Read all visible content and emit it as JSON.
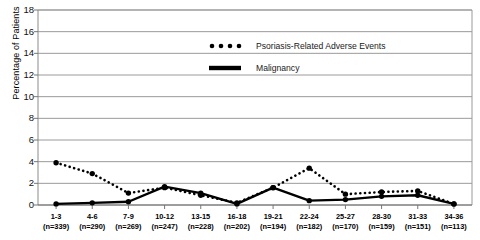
{
  "chart_data": {
    "type": "line",
    "title": "",
    "xlabel": "",
    "ylabel": "Percentage of Patients",
    "ylim": [
      0,
      18
    ],
    "yticks": [
      0,
      2,
      4,
      6,
      8,
      10,
      12,
      14,
      16,
      18
    ],
    "grid": true,
    "legend_position": "top-right",
    "categories": [
      "1-3",
      "4-6",
      "7-9",
      "10-12",
      "13-15",
      "16-18",
      "19-21",
      "22-24",
      "25-27",
      "28-30",
      "31-33",
      "34-36"
    ],
    "category_sublabels": [
      "(n=339)",
      "(n=290)",
      "(n=269)",
      "(n=247)",
      "(n=228)",
      "(n=202)",
      "(n=194)",
      "(n=182)",
      "(n=170)",
      "(n=159)",
      "(n=151)",
      "(n=113)"
    ],
    "series": [
      {
        "name": "Psoriasis-Related Adverse Events",
        "style": "dotted",
        "color": "#000000",
        "values": [
          3.9,
          2.9,
          1.1,
          1.6,
          0.9,
          0.2,
          1.6,
          3.4,
          1.0,
          1.2,
          1.3,
          0.1
        ]
      },
      {
        "name": "Malignancy",
        "style": "solid",
        "color": "#000000",
        "values": [
          0.1,
          0.2,
          0.3,
          1.7,
          1.1,
          0.1,
          1.6,
          0.4,
          0.5,
          0.8,
          0.9,
          0.1
        ]
      }
    ]
  },
  "axis": {
    "y_tick_labels": [
      "18",
      "16",
      "14",
      "12",
      "10",
      "8",
      "6",
      "4",
      "2",
      "0"
    ],
    "y_title": "Percentage of Patients"
  },
  "legend": {
    "items": [
      {
        "label": "Psoriasis-Related Adverse Events",
        "marker": "dotted-line-swatch"
      },
      {
        "label": "Malignancy",
        "marker": "solid-line-swatch"
      }
    ]
  }
}
